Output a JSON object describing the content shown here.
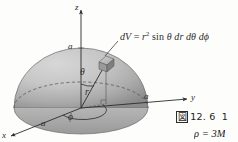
{
  "figure": {
    "kind": "spherical-coordinates-hemisphere-diagram",
    "background_color": "#fdfdfc",
    "ink_color": "#2b2b2b",
    "sphere_fill_light": "#c9c9c9",
    "sphere_fill_dark": "#8e8e8e",
    "formula": {
      "lead": "dV",
      "equals": "=",
      "r": "r",
      "exponent": "2",
      "sin": "sin",
      "theta": "θ",
      "dr": "dr",
      "dtheta": "dθ",
      "dphi": "dϕ",
      "full": "dV = r2 sin θ dr dθ dϕ"
    },
    "axes": [
      {
        "name": "z-axis",
        "label": "z",
        "direction": "up"
      },
      {
        "name": "y-axis",
        "label": "y",
        "direction": "right"
      },
      {
        "name": "x-axis",
        "label": "x",
        "direction": "down-left"
      }
    ],
    "radius_labels": [
      {
        "name": "radius-label-z",
        "label": "a"
      },
      {
        "name": "radius-label-y",
        "label": "a"
      },
      {
        "name": "radius-label-x",
        "label": "a"
      }
    ],
    "parameters": [
      {
        "name": "polar-angle",
        "label": "θ"
      },
      {
        "name": "radius",
        "label": "r"
      },
      {
        "name": "azimuthal-angle",
        "label": "ϕ"
      }
    ],
    "volume_element": {
      "name": "volume-element-cube",
      "label": "dV"
    }
  },
  "caption": {
    "figure_mark": "図",
    "number": "12. 6",
    "trailing": "1"
  },
  "density": {
    "text": "ρ = 3M"
  }
}
